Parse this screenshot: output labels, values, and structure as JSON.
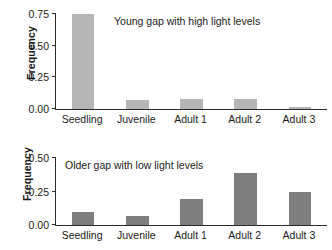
{
  "figure": {
    "background": "#ffffff",
    "bar_color_top": "#b6b6b6",
    "bar_color_bottom": "#7e7e7e",
    "axis_color": "#2b2b2b"
  },
  "chart_data": [
    {
      "type": "bar",
      "title": "",
      "annotation": "Young gap with high light levels",
      "categories": [
        "Seedling",
        "Juvenile",
        "Adult 1",
        "Adult 2",
        "Adult 3"
      ],
      "values": [
        0.75,
        0.07,
        0.08,
        0.08,
        0.015
      ],
      "xlabel": "",
      "ylabel": "Frequency",
      "ylim": [
        0,
        0.75
      ],
      "yticks": [
        0.0,
        0.25,
        0.5,
        0.75
      ],
      "ytick_labels": [
        "0.00",
        "0.25",
        "0.50",
        "0.75"
      ],
      "grid": false,
      "legend": "none"
    },
    {
      "type": "bar",
      "title": "",
      "annotation": "Older gap with low light levels",
      "categories": [
        "Seedling",
        "Juvenile",
        "Adult 1",
        "Adult 2",
        "Adult 3"
      ],
      "values": [
        0.095,
        0.065,
        0.195,
        0.385,
        0.25
      ],
      "xlabel": "",
      "ylabel": "Frequency",
      "ylim": [
        0,
        0.5
      ],
      "yticks": [
        0.0,
        0.25,
        0.5
      ],
      "ytick_labels": [
        "0.00",
        "0.25",
        "0.50"
      ],
      "grid": false,
      "legend": "none"
    }
  ]
}
